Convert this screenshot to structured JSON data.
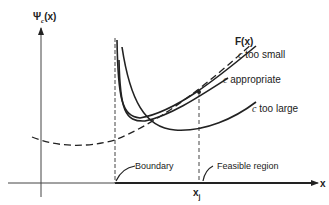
{
  "diagram": {
    "y_axis_label": "Ψ",
    "y_axis_sub": "c",
    "y_axis_arg": "(x)",
    "x_axis_label": "x",
    "xj_label": "x",
    "xj_sub": "j",
    "boundary_label": "Boundary",
    "feasible_label": "Feasible region",
    "curves": [
      {
        "id": "F",
        "label": "F(x)",
        "style": "dashed"
      },
      {
        "id": "c_small",
        "label_var": "c",
        "label_text": "too small",
        "style": "solid"
      },
      {
        "id": "c_appropriate",
        "label_var": "c",
        "label_text": "appropriate",
        "style": "solid"
      },
      {
        "id": "c_large",
        "label_var": "c",
        "label_text": "too large",
        "style": "solid"
      }
    ],
    "colors": {
      "line": "#222222",
      "background": "#ffffff"
    }
  }
}
